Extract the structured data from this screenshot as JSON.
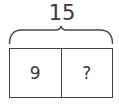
{
  "diagram": {
    "type": "tape-diagram",
    "total": "15",
    "parts": [
      {
        "label": "9"
      },
      {
        "label": "?"
      }
    ],
    "colors": {
      "stroke": "#444444",
      "text": "#3a3a3a",
      "background": "#ffffff"
    }
  }
}
